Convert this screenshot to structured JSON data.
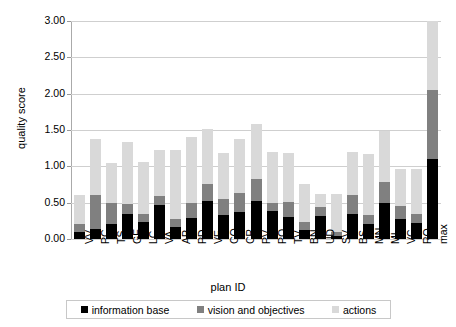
{
  "chart_data": {
    "type": "bar",
    "stacked": true,
    "title": "",
    "xlabel": "plan ID",
    "ylabel": "quality score",
    "ylim": [
      0,
      3.0
    ],
    "ytick_step": 0.5,
    "ytick_labels": [
      "3.00",
      "2.50",
      "2.00",
      "1.50",
      "1.00",
      "0.50",
      "0.00"
    ],
    "ytick_values": [
      3.0,
      2.5,
      2.0,
      1.5,
      1.0,
      0.5,
      0.0
    ],
    "grid": true,
    "legend_position": "bottom",
    "categories": [
      "VV",
      "PC",
      "TS",
      "GE",
      "LC",
      "VA",
      "AP",
      "PD",
      "VE",
      "CO",
      "CR",
      "PV",
      "PO",
      "TV",
      "BN",
      "UD",
      "SV",
      "BS",
      "MN",
      "MI",
      "VC",
      "RO",
      "max"
    ],
    "series": [
      {
        "name": "information base",
        "color": "#000000",
        "values": [
          0.1,
          0.14,
          0.2,
          0.34,
          0.24,
          0.47,
          0.17,
          0.29,
          0.52,
          0.33,
          0.37,
          0.53,
          0.38,
          0.3,
          0.12,
          0.31,
          0.04,
          0.34,
          0.21,
          0.49,
          0.27,
          0.22,
          1.1
        ]
      },
      {
        "name": "vision and objectives",
        "color": "#808080",
        "values": [
          0.1,
          0.47,
          0.29,
          0.14,
          0.11,
          0.12,
          0.11,
          0.21,
          0.24,
          0.22,
          0.26,
          0.3,
          0.11,
          0.21,
          0.11,
          0.13,
          0.05,
          0.27,
          0.12,
          0.3,
          0.19,
          0.12,
          0.95
        ]
      },
      {
        "name": "actions",
        "color": "#d9d9d9",
        "values": [
          0.4,
          0.77,
          0.56,
          0.85,
          0.71,
          0.64,
          0.94,
          0.9,
          0.76,
          0.63,
          0.75,
          0.75,
          0.71,
          0.68,
          0.53,
          0.18,
          0.53,
          0.59,
          0.84,
          0.7,
          0.51,
          0.62,
          0.95
        ]
      }
    ],
    "totals": [
      0.6,
      1.38,
      1.05,
      1.33,
      1.06,
      1.23,
      1.22,
      1.4,
      1.52,
      1.18,
      1.38,
      1.58,
      1.2,
      1.19,
      0.76,
      0.62,
      0.62,
      1.2,
      1.17,
      1.49,
      0.97,
      0.96,
      3.0
    ]
  },
  "legend": {
    "items": [
      {
        "label": "information base",
        "color": "#000000",
        "icon": "square-swatch-icon"
      },
      {
        "label": "vision and objectives",
        "color": "#808080",
        "icon": "square-swatch-icon"
      },
      {
        "label": "actions",
        "color": "#d9d9d9",
        "icon": "square-swatch-icon"
      }
    ]
  }
}
